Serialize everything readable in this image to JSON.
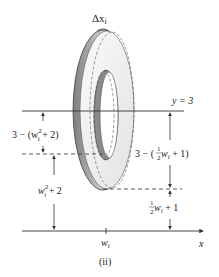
{
  "diagram": {
    "caption": "(ii)",
    "labels": {
      "delta_x": "Δx",
      "delta_x_sub": "i",
      "line_y3": "y = 3",
      "upper_left_gap": "3 − (w",
      "upper_left_gap_sup": "2",
      "upper_left_gap_sub": "i",
      "upper_left_gap_tail": " + 2)",
      "lower_left": "w",
      "lower_left_sup": "2",
      "lower_left_sub": "i",
      "lower_left_tail": " + 2",
      "upper_right_pre": "3 − (",
      "upper_right_frac_num": "1",
      "upper_right_frac_den": "2",
      "upper_right_var": " w",
      "upper_right_sub": "i",
      "upper_right_tail": " + 1)",
      "lower_right_frac_num": "1",
      "lower_right_frac_den": "2",
      "lower_right_var": " w",
      "lower_right_sub": "i",
      "lower_right_tail": " + 1",
      "x_tick": "w",
      "x_tick_sub": "i",
      "x_axis": "x"
    },
    "colors": {
      "line": "#333333",
      "washer_face": "#f2f2f2",
      "washer_edge": "#9a9a9a"
    }
  }
}
